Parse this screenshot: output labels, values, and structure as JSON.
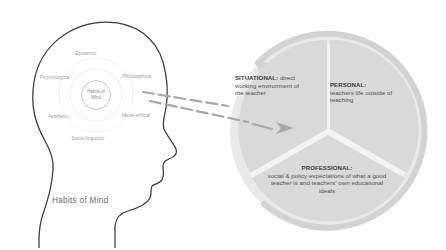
{
  "figure": {
    "caption": "Habits of Mind"
  },
  "head_diagram": {
    "center_line1": "Habits of",
    "center_line2": "Mind",
    "labels": [
      {
        "text": "Epistemic",
        "x": 86,
        "y": 53
      },
      {
        "text": "Psychological",
        "x": 55,
        "y": 77
      },
      {
        "text": "Philosophical",
        "x": 137,
        "y": 76
      },
      {
        "text": "Aesthetic",
        "x": 58,
        "y": 116
      },
      {
        "text": "Moral-ethical",
        "x": 136,
        "y": 115
      },
      {
        "text": "Socio-linguistic",
        "x": 88,
        "y": 138
      }
    ]
  },
  "circle_diagram": {
    "sectors": [
      {
        "id": "situational",
        "title": "SITUATIONAL:",
        "body": " direct working environment of the teacher"
      },
      {
        "id": "personal",
        "title": "PERSONAL:",
        "body": "teachers life outside of teaching"
      },
      {
        "id": "professional",
        "title": "PROFESSIONAL:",
        "body": "social & policy expectations of what a good teacher is and teachers' own educational ideals"
      }
    ]
  },
  "colors": {
    "sector_fill": "#d9d9d9",
    "ring_fill": "#e4e4e4",
    "outline": "#3a3a3a",
    "arrow": "#9e9e9e",
    "faint_text": "#9a9a9a"
  }
}
